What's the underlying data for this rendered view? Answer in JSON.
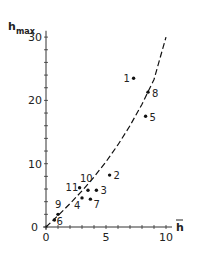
{
  "chart_data": {
    "type": "scatter",
    "title": "",
    "xlabel": "h̄",
    "ylabel": "h_max",
    "xlim": [
      0,
      10.5
    ],
    "ylim": [
      0,
      31
    ],
    "grid": false,
    "legend": null,
    "x_ticks": [
      0,
      5,
      10
    ],
    "x_tick_labels": [
      "0",
      "5",
      "10"
    ],
    "y_ticks": [
      0,
      10,
      20,
      30
    ],
    "y_tick_labels": [
      "0",
      "10",
      "20",
      "30"
    ],
    "x_minor_step": 1,
    "y_minor_step": 2,
    "series": [
      {
        "name": "observations",
        "style": "dot",
        "points": [
          {
            "label": "1",
            "x": 7.3,
            "y": 23.5
          },
          {
            "label": "2",
            "x": 5.3,
            "y": 8.2
          },
          {
            "label": "3",
            "x": 4.2,
            "y": 5.8
          },
          {
            "label": "4",
            "x": 3.0,
            "y": 4.6
          },
          {
            "label": "5",
            "x": 8.3,
            "y": 17.5
          },
          {
            "label": "6",
            "x": 0.7,
            "y": 1.1
          },
          {
            "label": "7",
            "x": 3.7,
            "y": 4.4
          },
          {
            "label": "8",
            "x": 8.5,
            "y": 21.3
          },
          {
            "label": "9",
            "x": 1.0,
            "y": 2.0
          },
          {
            "label": "10",
            "x": 3.5,
            "y": 5.8
          },
          {
            "label": "11",
            "x": 2.8,
            "y": 6.2
          }
        ]
      },
      {
        "name": "fit",
        "style": "dashed-curve",
        "x": [
          0,
          1,
          2,
          3,
          4,
          5,
          6,
          7,
          8,
          9,
          10
        ],
        "y": [
          0,
          1.8,
          3.7,
          5.7,
          7.9,
          10.3,
          13.0,
          16.0,
          19.4,
          23.3,
          30.0
        ]
      }
    ]
  }
}
